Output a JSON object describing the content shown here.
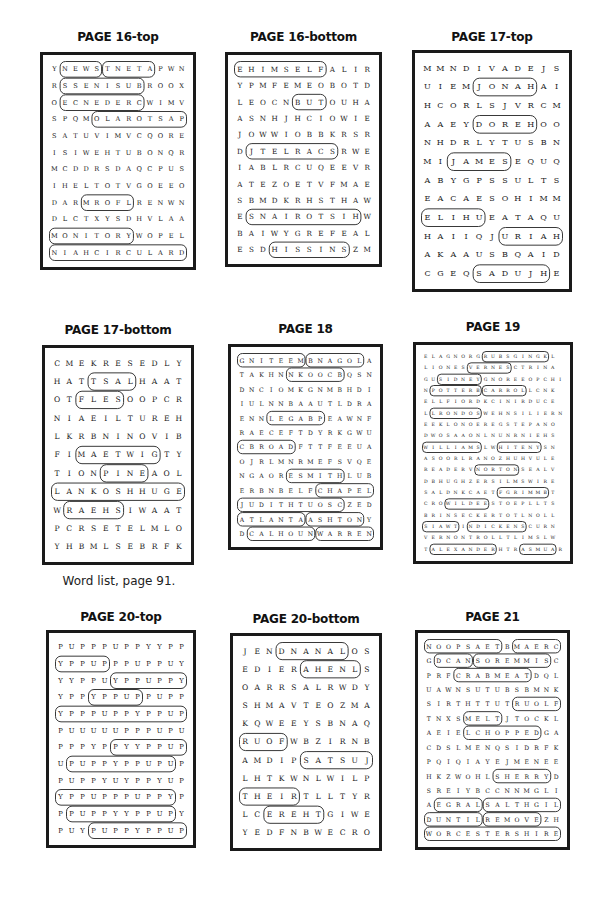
{
  "caption": "Word list, page 91.",
  "puzzles": [
    {
      "title": "PAGE 16-top",
      "x": 40,
      "y": 52,
      "w": 156,
      "h": 218,
      "titleY": 30,
      "rows": [
        "YNEWSTNETAPWN",
        "RSSENISUBROOX",
        "OECNEDERCWIMV",
        "SPQMOLAROTSAP",
        "SATUVIMVCQORE",
        "ISIWEHTUBONQR",
        "MCDDRSDAQCPUS",
        "IHELTOTVGOEEO",
        "DARMROFLRENWN",
        "DLCTXYSDHVLAA",
        "MONITORYWOPEL",
        "NIAHCIRCULARD"
      ],
      "words": [
        {
          "r1": 0,
          "c1": 1,
          "r2": 0,
          "c2": 4
        },
        {
          "r1": 0,
          "c1": 5,
          "r2": 0,
          "c2": 9
        },
        {
          "r1": 1,
          "c1": 1,
          "r2": 1,
          "c2": 8
        },
        {
          "r1": 2,
          "c1": 1,
          "r2": 2,
          "c2": 8
        },
        {
          "r1": 3,
          "c1": 4,
          "r2": 3,
          "c2": 12
        },
        {
          "r1": 8,
          "c1": 3,
          "r2": 8,
          "c2": 7
        },
        {
          "r1": 10,
          "c1": 0,
          "r2": 10,
          "c2": 7
        },
        {
          "r1": 11,
          "c1": 0,
          "r2": 11,
          "c2": 12
        }
      ]
    },
    {
      "title": "PAGE 16-bottom",
      "x": 225,
      "y": 52,
      "w": 157,
      "h": 215,
      "titleY": 30,
      "rows": [
        "EHIMSELFALIR",
        "YPMFEMEOBOTD",
        "LEOCNBUTOUHA",
        "ASNHJHCIOWIE",
        "JOWWIOBBKRSR",
        "DJTELRACSRWE",
        "IABLRCUQEEVR",
        "ATEZOETVFMAE",
        "SBMDKRHSTHAW",
        "ESNAIROTSIHW",
        "BAIWYGREFEAL",
        "ESDHISSINSZM"
      ],
      "words": [
        {
          "r1": 0,
          "c1": 0,
          "r2": 0,
          "c2": 7
        },
        {
          "r1": 2,
          "c1": 5,
          "r2": 2,
          "c2": 7
        },
        {
          "r1": 5,
          "c1": 1,
          "r2": 5,
          "c2": 8
        },
        {
          "r1": 9,
          "c1": 1,
          "r2": 9,
          "c2": 10
        },
        {
          "r1": 11,
          "c1": 3,
          "r2": 11,
          "c2": 9
        }
      ]
    },
    {
      "title": "PAGE 17-top",
      "x": 412,
      "y": 50,
      "w": 160,
      "h": 242,
      "titleY": 30,
      "rows": [
        "MMNDIVADEJS",
        "UIEMJONAHAI",
        "HCORLSJVRCM",
        "AAEYDOREHOO",
        "NHDRLYTUSBN",
        "MIJAMESEQUQ",
        "ABYGPSSULTS",
        "EACAESOHIMM",
        "ELIHUEATAQU",
        "HAIIQJURIAH",
        "AKAAUSBQAID",
        "CGEQSADUJHE"
      ],
      "words": [
        {
          "r1": 1,
          "c1": 4,
          "r2": 1,
          "c2": 8
        },
        {
          "r1": 3,
          "c1": 4,
          "r2": 3,
          "c2": 8
        },
        {
          "r1": 5,
          "c1": 2,
          "r2": 5,
          "c2": 6
        },
        {
          "r1": 8,
          "c1": 0,
          "r2": 8,
          "c2": 4
        },
        {
          "r1": 9,
          "c1": 6,
          "r2": 9,
          "c2": 10
        },
        {
          "r1": 11,
          "c1": 4,
          "r2": 11,
          "c2": 9
        }
      ]
    },
    {
      "title": "PAGE 17-bottom",
      "x": 42,
      "y": 345,
      "w": 152,
      "h": 220,
      "titleY": 323,
      "rows": [
        "CMEKRESEDLY",
        "HATTSALHAAT",
        "OTFLESOOPCR",
        "NIAEILTUREH",
        "LKRBNINOVIB",
        "FIMAETWIGTY",
        "TIONPINEAOL",
        "LANKOSHHUGE",
        "WRAEHSIWAAT",
        "PCRSETELMLO",
        "YHBMLSEBRFK"
      ],
      "words": [
        {
          "r1": 1,
          "c1": 3,
          "r2": 1,
          "c2": 6
        },
        {
          "r1": 2,
          "c1": 2,
          "r2": 2,
          "c2": 5
        },
        {
          "r1": 5,
          "c1": 2,
          "r2": 5,
          "c2": 8
        },
        {
          "r1": 6,
          "c1": 4,
          "r2": 6,
          "c2": 7
        },
        {
          "r1": 7,
          "c1": 0,
          "r2": 7,
          "c2": 10
        },
        {
          "r1": 8,
          "c1": 1,
          "r2": 8,
          "c2": 5
        }
      ]
    },
    {
      "title": "PAGE 18",
      "x": 228,
      "y": 344,
      "w": 155,
      "h": 206,
      "titleY": 322,
      "rows": [
        "GNITEEMBNAGOLA",
        "TAKHNNKOOCBQSN",
        "DNCIOMKGNMBHDI",
        "IULNNBAAUTLDRA",
        "ENNLEGABPEAWNF",
        "RAECEFTDYRKGWU",
        "CBROADFTTFEEUA",
        "OJRLMNRMEFSVQE",
        "NGAORESMITHLUB",
        "ERBNBELFCHAPEL",
        "JUDITHTUOSCZED",
        "ATLANTAASHTONY",
        "DCALHOUNWARREN"
      ],
      "words": [
        {
          "r1": 0,
          "c1": 0,
          "r2": 0,
          "c2": 6
        },
        {
          "r1": 0,
          "c1": 7,
          "r2": 0,
          "c2": 12
        },
        {
          "r1": 1,
          "c1": 5,
          "r2": 1,
          "c2": 10
        },
        {
          "r1": 4,
          "c1": 3,
          "r2": 4,
          "c2": 8
        },
        {
          "r1": 6,
          "c1": 0,
          "r2": 6,
          "c2": 5
        },
        {
          "r1": 8,
          "c1": 5,
          "r2": 8,
          "c2": 10
        },
        {
          "r1": 9,
          "c1": 8,
          "r2": 9,
          "c2": 13
        },
        {
          "r1": 10,
          "c1": 0,
          "r2": 10,
          "c2": 10
        },
        {
          "r1": 11,
          "c1": 0,
          "r2": 11,
          "c2": 6
        },
        {
          "r1": 11,
          "c1": 7,
          "r2": 11,
          "c2": 12
        },
        {
          "r1": 12,
          "c1": 1,
          "r2": 12,
          "c2": 7
        },
        {
          "r1": 12,
          "c1": 8,
          "r2": 12,
          "c2": 13
        }
      ]
    },
    {
      "title": "PAGE 19",
      "x": 413,
      "y": 342,
      "w": 160,
      "h": 222,
      "titleY": 320,
      "rows": [
        "ELAGNORGRUBSGINGKL",
        "LIONESVERNESCTRINA",
        "GUSIDNEYGNOREEOPCHI",
        "NPOTTERBCARROLLCNK",
        "ELLFIORDKCINIRDUCE",
        "LLRONDOSWEHNSILIERN",
        "EEKLONOEREGSTEPANO",
        "DWOSAAONLNUNRNIEHS",
        "WILLIAMSLWHITENYSN",
        "ASOORLRANOZHUHVULE",
        "READERVNORTONSEALV",
        "DBHUGHZERSILMSWIRE",
        "SALDNKCAETFGRIMMBT",
        "CROWILDEESTOEPLLTS",
        "BRINSECKERTOTLNOLL",
        "SIAWTINDICKENSCURN",
        "VERNONTROLLTLIMSLW",
        "TALEXANDERHTRASMUAR"
      ],
      "words": [
        {
          "r1": 0,
          "c1": 8,
          "r2": 0,
          "c2": 16
        },
        {
          "r1": 1,
          "c1": 6,
          "r2": 1,
          "c2": 11
        },
        {
          "r1": 2,
          "c1": 2,
          "r2": 2,
          "c2": 7
        },
        {
          "r1": 3,
          "c1": 1,
          "r2": 3,
          "c2": 7
        },
        {
          "r1": 3,
          "c1": 8,
          "r2": 3,
          "c2": 13
        },
        {
          "r1": 5,
          "c1": 1,
          "r2": 5,
          "c2": 7
        },
        {
          "r1": 8,
          "c1": 0,
          "r2": 8,
          "c2": 7
        },
        {
          "r1": 8,
          "c1": 10,
          "r2": 8,
          "c2": 15
        },
        {
          "r1": 10,
          "c1": 7,
          "r2": 10,
          "c2": 12
        },
        {
          "r1": 12,
          "c1": 10,
          "r2": 12,
          "c2": 16
        },
        {
          "r1": 13,
          "c1": 3,
          "r2": 13,
          "c2": 8
        },
        {
          "r1": 15,
          "c1": 0,
          "r2": 15,
          "c2": 4
        },
        {
          "r1": 15,
          "c1": 6,
          "r2": 15,
          "c2": 13
        },
        {
          "r1": 17,
          "c1": 1,
          "r2": 17,
          "c2": 9
        },
        {
          "r1": 17,
          "c1": 13,
          "r2": 17,
          "c2": 17
        }
      ]
    },
    {
      "title": "PAGE 20-top",
      "x": 46,
      "y": 630,
      "w": 150,
      "h": 218,
      "titleY": 610,
      "rows": [
        "PUPPPUPPYYPP",
        "YPPUPPPUPPUY",
        "YYPPUYPPUPPY",
        "YPPYPPUPPUPP",
        "YPPPUPPYPPUP",
        "PUUUUUPPPUPU",
        "PPPYPPYYPPUP",
        "UPUPPYPPUPUP",
        "PUPPYUYPPYUP",
        "YPPUPPPUPPYP",
        "PPUPPYYPPUPY",
        "PUYPUPPYPPUP"
      ],
      "words": [
        {
          "r1": 1,
          "c1": 0,
          "r2": 1,
          "c2": 4
        },
        {
          "r1": 2,
          "c1": 5,
          "r2": 2,
          "c2": 11
        },
        {
          "r1": 3,
          "c1": 3,
          "r2": 3,
          "c2": 7
        },
        {
          "r1": 4,
          "c1": 0,
          "r2": 4,
          "c2": 11
        },
        {
          "r1": 6,
          "c1": 5,
          "r2": 6,
          "c2": 11
        },
        {
          "r1": 7,
          "c1": 1,
          "r2": 7,
          "c2": 10
        },
        {
          "r1": 9,
          "c1": 0,
          "r2": 9,
          "c2": 10
        },
        {
          "r1": 10,
          "c1": 1,
          "r2": 10,
          "c2": 10
        },
        {
          "r1": 11,
          "c1": 3,
          "r2": 11,
          "c2": 11
        }
      ]
    },
    {
      "title": "PAGE 20-bottom",
      "x": 230,
      "y": 633,
      "w": 152,
      "h": 218,
      "titleY": 612,
      "rows": [
        "JENDNANALOS",
        "EDIERAHENLS",
        "OARRSALRWDY",
        "SHMAVTEOZMA",
        "KQWEEYSBNAQ",
        "RUOFWBZIRNB",
        "AMDIPSATSUJ",
        "LHTKWNLWILP",
        "THEIRTLLTYR",
        "LCEREHTGIWE",
        "YEDFNBWECRO"
      ],
      "words": [
        {
          "r1": 0,
          "c1": 3,
          "r2": 0,
          "c2": 8
        },
        {
          "r1": 1,
          "c1": 5,
          "r2": 1,
          "c2": 9
        },
        {
          "r1": 5,
          "c1": 0,
          "r2": 5,
          "c2": 3
        },
        {
          "r1": 6,
          "c1": 5,
          "r2": 6,
          "c2": 10
        },
        {
          "r1": 8,
          "c1": 0,
          "r2": 8,
          "c2": 4
        },
        {
          "r1": 9,
          "c1": 2,
          "r2": 9,
          "c2": 6
        }
      ]
    },
    {
      "title": "PAGE 21",
      "x": 415,
      "y": 630,
      "w": 155,
      "h": 220,
      "titleY": 610,
      "rows": [
        "NOOPSAETBMAERC",
        "GDCANSOREMMISC",
        "PRFCRABMEATDQL",
        "UAWNSUTUBSBMNK",
        "SIRTHTTUTRUOLF",
        "TNXSMELTJTOCKL",
        "AEIELCHOPPEDGA",
        "CDSLMENQSIDRFK",
        "PQIQIAYEJMENEE",
        "HKZWOHLSHERRYD",
        "SREIYBCCNNMGLI",
        "AEGRALSALTHGIL",
        "DUNTILREMOVEZH",
        "WORCESTERSHIRE"
      ],
      "words": [
        {
          "r1": 0,
          "c1": 0,
          "r2": 0,
          "c2": 7
        },
        {
          "r1": 0,
          "c1": 9,
          "r2": 0,
          "c2": 13
        },
        {
          "r1": 1,
          "c1": 1,
          "r2": 1,
          "c2": 4
        },
        {
          "r1": 1,
          "c1": 5,
          "r2": 1,
          "c2": 12
        },
        {
          "r1": 2,
          "c1": 3,
          "r2": 2,
          "c2": 10
        },
        {
          "r1": 4,
          "c1": 9,
          "r2": 4,
          "c2": 13
        },
        {
          "r1": 5,
          "c1": 4,
          "r2": 5,
          "c2": 7
        },
        {
          "r1": 6,
          "c1": 4,
          "r2": 6,
          "c2": 11
        },
        {
          "r1": 9,
          "c1": 7,
          "r2": 9,
          "c2": 12
        },
        {
          "r1": 11,
          "c1": 1,
          "r2": 11,
          "c2": 5
        },
        {
          "r1": 11,
          "c1": 6,
          "r2": 11,
          "c2": 13
        },
        {
          "r1": 12,
          "c1": 0,
          "r2": 12,
          "c2": 5
        },
        {
          "r1": 12,
          "c1": 6,
          "r2": 12,
          "c2": 11
        },
        {
          "r1": 13,
          "c1": 0,
          "r2": 13,
          "c2": 13
        }
      ]
    }
  ],
  "caption_pos": {
    "x": 40,
    "y": 574,
    "w": 158
  }
}
